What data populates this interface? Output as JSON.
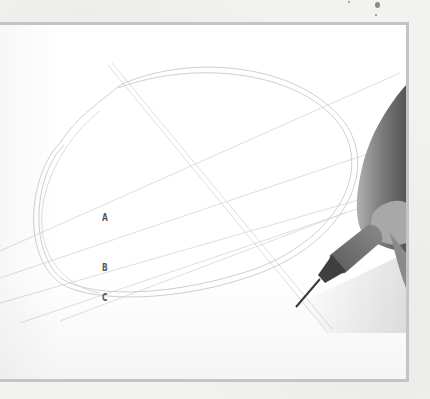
{
  "illustration": {
    "subject": "hand drawing an ellipse with a mechanical pencil",
    "labels": [
      {
        "text": "A"
      },
      {
        "text": "B"
      },
      {
        "text": "C"
      }
    ]
  },
  "colors": {
    "page_background": "#f2f2f0",
    "frame_border": "#c4c4c4",
    "paper": "#ffffff",
    "pencil_line": "#cfcfcf",
    "label_text": "#555555",
    "skin": "#8c8c8c",
    "pencil_grip": "#6e6e6e"
  }
}
